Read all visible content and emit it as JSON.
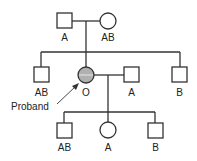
{
  "diagram": {
    "type": "pedigree",
    "colors": {
      "line": "#333333",
      "proband_fill": "#b0b0b0",
      "background": "#ffffff"
    },
    "generations": [
      {
        "level": "I",
        "individuals": [
          {
            "id": "I-1",
            "sex": "male",
            "shape": "square",
            "blood_type": "A"
          },
          {
            "id": "I-2",
            "sex": "female",
            "shape": "circle",
            "blood_type": "AB"
          }
        ]
      },
      {
        "level": "II",
        "individuals": [
          {
            "id": "II-1",
            "sex": "male",
            "shape": "square",
            "blood_type": "AB"
          },
          {
            "id": "II-2",
            "sex": "female",
            "shape": "circle",
            "blood_type": "O",
            "affected": true,
            "proband": true
          },
          {
            "id": "II-spouse",
            "sex": "male",
            "shape": "square",
            "blood_type": "A"
          },
          {
            "id": "II-3",
            "sex": "male",
            "shape": "square",
            "blood_type": "B"
          }
        ]
      },
      {
        "level": "III",
        "individuals": [
          {
            "id": "III-1",
            "sex": "male",
            "shape": "square",
            "blood_type": "AB"
          },
          {
            "id": "III-2",
            "sex": "female",
            "shape": "circle",
            "blood_type": "A"
          },
          {
            "id": "III-3",
            "sex": "male",
            "shape": "square",
            "blood_type": "B"
          }
        ]
      }
    ],
    "labels": {
      "g1_father": "A",
      "g1_mother": "AB",
      "g2_brother1": "AB",
      "g2_proband": "O",
      "g2_spouse": "A",
      "g2_brother2": "B",
      "g3_son1": "AB",
      "g3_daughter": "A",
      "g3_son2": "B",
      "proband_annotation": "Proband"
    }
  }
}
